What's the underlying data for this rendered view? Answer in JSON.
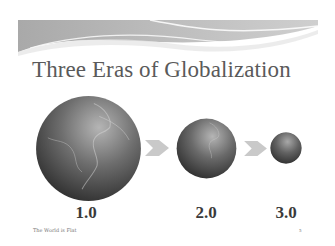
{
  "slide": {
    "title": "Three Eras of Globalization",
    "eras": [
      {
        "label": "1.0",
        "globe_size": "large"
      },
      {
        "label": "2.0",
        "globe_size": "medium"
      },
      {
        "label": "3.0",
        "globe_size": "small"
      }
    ],
    "arrows": [
      {
        "icon": "chevron-right-icon"
      },
      {
        "icon": "chevron-right-icon"
      }
    ],
    "footer": {
      "text": "The World is Flat",
      "page_number": "5"
    }
  },
  "colors": {
    "title": "#5a5a5a",
    "banner": "#b8b8b8",
    "arrow": "#c8c8c8",
    "globe_dark": "#2e2e2e",
    "globe_light": "#a0a0a0"
  }
}
